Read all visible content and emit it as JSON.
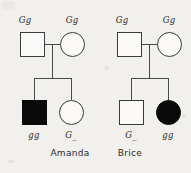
{
  "diagram": {
    "type": "genetics-pedigree",
    "background_color": "#f2f0ec",
    "line_color": "#4a4a4a",
    "affected_fill": "#0a0a0a",
    "unaffected_fill": "#faf9f7",
    "legend_note": "Filled symbol = affected individual; open symbol = unaffected"
  },
  "families": [
    {
      "name": "Amanda",
      "generation1": [
        {
          "symbol": "square",
          "sex": "male",
          "genotype": "Gg",
          "affected": false
        },
        {
          "symbol": "circle",
          "sex": "female",
          "genotype": "Gg",
          "affected": false
        }
      ],
      "generation2": [
        {
          "symbol": "square",
          "sex": "male",
          "genotype": "gg",
          "affected": true
        },
        {
          "symbol": "circle",
          "sex": "female",
          "genotype": "G_",
          "affected": false
        }
      ]
    },
    {
      "name": "Brice",
      "generation1": [
        {
          "symbol": "square",
          "sex": "male",
          "genotype": "Gg",
          "affected": false
        },
        {
          "symbol": "circle",
          "sex": "female",
          "genotype": "Gg",
          "affected": false
        }
      ],
      "generation2": [
        {
          "symbol": "square",
          "sex": "male",
          "genotype": "G_",
          "affected": false
        },
        {
          "symbol": "circle",
          "sex": "female",
          "genotype": "gg",
          "affected": true
        }
      ]
    }
  ]
}
